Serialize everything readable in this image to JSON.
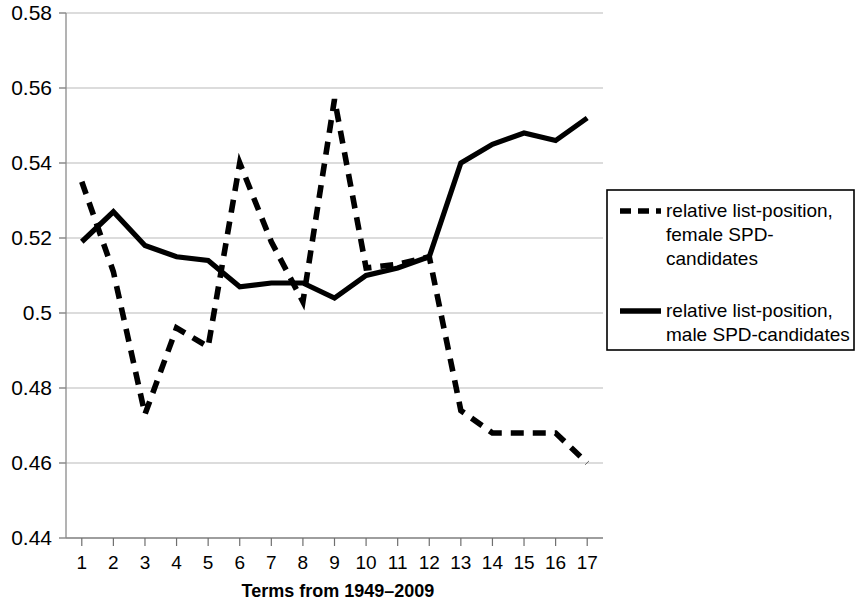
{
  "chart_data": {
    "type": "line",
    "title": "",
    "xlabel": "Terms from 1949–2009",
    "ylabel": "",
    "categories": [
      "1",
      "2",
      "3",
      "4",
      "5",
      "6",
      "7",
      "8",
      "9",
      "10",
      "11",
      "12",
      "13",
      "14",
      "15",
      "16",
      "17"
    ],
    "x": [
      1,
      2,
      3,
      4,
      5,
      6,
      7,
      8,
      9,
      10,
      11,
      12,
      13,
      14,
      15,
      16,
      17
    ],
    "xlim": [
      0.5,
      17.5
    ],
    "ylim": [
      0.44,
      0.58
    ],
    "ytick_labels": [
      "0.58",
      "0.56",
      "0.54",
      "0.52",
      "0.5",
      "0.48",
      "0.46",
      "0.44"
    ],
    "ytick_values": [
      0.58,
      0.56,
      0.54,
      0.52,
      0.5,
      0.48,
      0.46,
      0.44
    ],
    "grid": true,
    "legend_position": "right",
    "series": [
      {
        "name": "relative list-position, female SPD-candidates",
        "style": "dashed",
        "color": "#000000",
        "values": [
          0.535,
          0.511,
          0.473,
          0.496,
          0.491,
          0.54,
          0.519,
          0.503,
          0.557,
          0.512,
          0.513,
          0.515,
          0.474,
          0.468,
          0.468,
          0.468,
          0.46
        ]
      },
      {
        "name": "relative list-position, male SPD-candidates",
        "style": "solid",
        "color": "#000000",
        "values": [
          0.519,
          0.527,
          0.518,
          0.515,
          0.514,
          0.507,
          0.508,
          0.508,
          0.504,
          0.51,
          0.512,
          0.515,
          0.54,
          0.545,
          0.548,
          0.546,
          0.552
        ]
      }
    ]
  },
  "legend": {
    "entries": [
      {
        "label_line1": "relative list-position,",
        "label_line2": "female SPD-",
        "label_line3": "candidates",
        "style": "dashed"
      },
      {
        "label_line1": "relative list-position,",
        "label_line2": "male SPD-candidates",
        "label_line3": "",
        "style": "solid"
      }
    ]
  }
}
